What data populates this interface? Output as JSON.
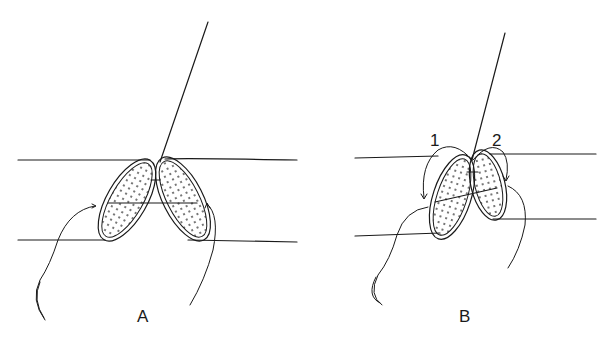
{
  "figure": {
    "panels": [
      {
        "id": "A",
        "label": "A"
      },
      {
        "id": "B",
        "label": "B",
        "step_labels": [
          "1",
          "2"
        ]
      }
    ]
  },
  "colors": {
    "stroke": "#1a1a1a",
    "background": "#ffffff",
    "stipple": "#333333"
  }
}
